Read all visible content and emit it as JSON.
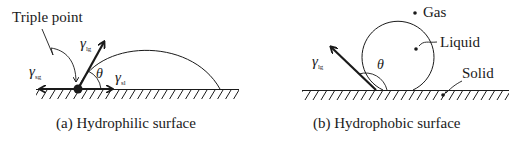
{
  "panels": [
    {
      "id": "a",
      "caption": "(a) Hydrophilic surface",
      "labels": {
        "triple_point": "Triple point",
        "gamma_sg": "γ",
        "gamma_sg_sub": "sg",
        "gamma_lg": "γ",
        "gamma_lg_sub": "lg",
        "gamma_sl": "γ",
        "gamma_sl_sub": "sl",
        "theta": "θ"
      }
    },
    {
      "id": "b",
      "caption": "(b) Hydrophobic surface",
      "labels": {
        "gas": "Gas",
        "liquid": "Liquid",
        "solid": "Solid",
        "gamma_lg": "γ",
        "gamma_lg_sub": "lg",
        "theta": "θ"
      }
    }
  ],
  "colors": {
    "ink": "#1a1a1a",
    "background": "#ffffff"
  }
}
